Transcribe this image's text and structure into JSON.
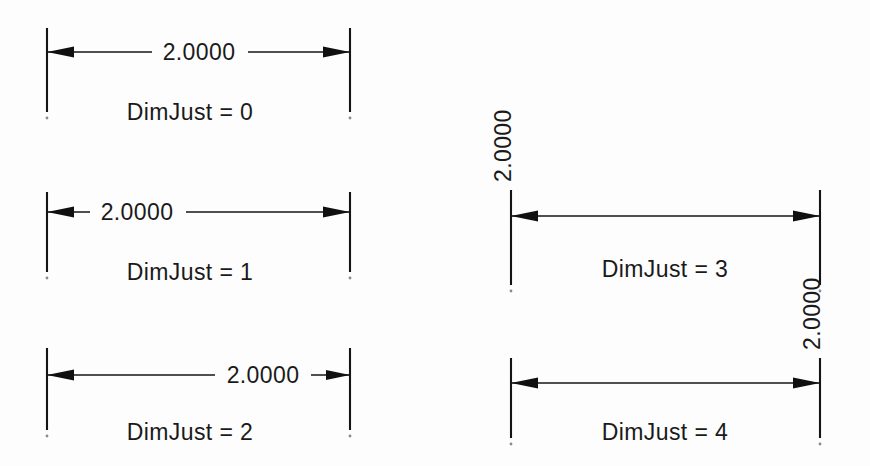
{
  "figure": {
    "background_color": "#fdfdfd",
    "ink_color": "#141414",
    "dimension_value": "2.0000",
    "groups": [
      {
        "id": "dimjust-0",
        "caption": "DimJust = 0",
        "value": "2.0000",
        "text_placement": "centered",
        "text_orientation": "horizontal",
        "ext_left_x": 47,
        "ext_right_x": 350,
        "ext_top_y": 28,
        "ext_bottom_y": 112,
        "dim_line_y": 52,
        "text_x": 199,
        "text_y": 60,
        "caption_x": 190,
        "caption_y": 120,
        "gap_left_x": 152,
        "gap_right_x": 248
      },
      {
        "id": "dimjust-1",
        "caption": "DimJust = 1",
        "value": "2.0000",
        "text_placement": "left",
        "text_orientation": "horizontal",
        "ext_left_x": 47,
        "ext_right_x": 350,
        "ext_top_y": 192,
        "ext_bottom_y": 272,
        "dim_line_y": 212,
        "text_x": 137,
        "text_y": 220,
        "caption_x": 190,
        "caption_y": 280,
        "gap_left_x": 90,
        "gap_right_x": 186
      },
      {
        "id": "dimjust-2",
        "caption": "DimJust = 2",
        "value": "2.0000",
        "text_placement": "right",
        "text_orientation": "horizontal",
        "ext_left_x": 47,
        "ext_right_x": 350,
        "ext_top_y": 348,
        "ext_bottom_y": 430,
        "dim_line_y": 375,
        "text_x": 263,
        "text_y": 383,
        "caption_x": 190,
        "caption_y": 440,
        "gap_left_x": 215,
        "gap_right_x": 311
      },
      {
        "id": "dimjust-3",
        "caption": "DimJust = 3",
        "value": "2.0000",
        "text_placement": "above-left-extension",
        "text_orientation": "vertical",
        "ext_left_x": 511,
        "ext_right_x": 820,
        "ext_top_y": 190,
        "ext_bottom_y": 285,
        "dim_line_y": 216,
        "text_x": 511,
        "text_y": 182,
        "caption_x": 665,
        "caption_y": 277
      },
      {
        "id": "dimjust-4",
        "caption": "DimJust = 4",
        "value": "2.0000",
        "text_placement": "above-right-extension",
        "text_orientation": "vertical",
        "ext_left_x": 511,
        "ext_right_x": 820,
        "ext_top_y": 358,
        "ext_bottom_y": 438,
        "dim_line_y": 383,
        "text_x": 820,
        "text_y": 350,
        "caption_x": 665,
        "caption_y": 440
      }
    ]
  }
}
